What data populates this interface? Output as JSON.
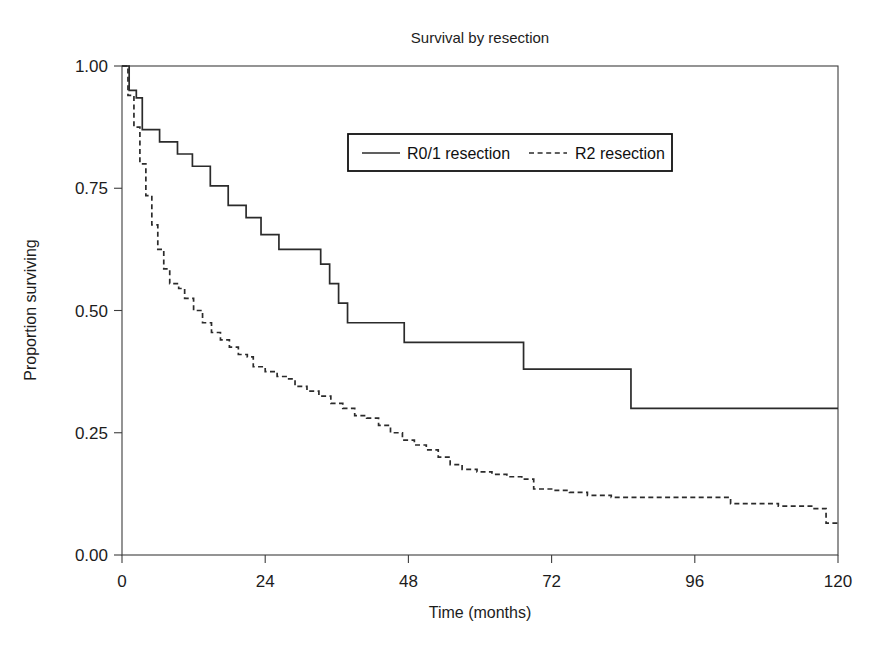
{
  "chart_data": {
    "type": "line",
    "title": "Survival by resection",
    "xlabel": "Time (months)",
    "ylabel": "Proportion surviving",
    "xlim": [
      0,
      120
    ],
    "ylim": [
      0,
      1
    ],
    "xticks": [
      0,
      24,
      48,
      72,
      96,
      120
    ],
    "xtick_labels": [
      "0",
      "24",
      "48",
      "72",
      "96",
      "120"
    ],
    "yticks": [
      0.0,
      0.25,
      0.5,
      0.75,
      1.0
    ],
    "ytick_labels": [
      "0.00",
      "0.25",
      "0.50",
      "0.75",
      "1.00"
    ],
    "grid": false,
    "legend_position": "upper center",
    "curve_style": "step-post",
    "series": [
      {
        "name": "R0/1 resection",
        "line_style": "solid",
        "color": "#2b2b2b",
        "points": [
          [
            0,
            1.0
          ],
          [
            1.2,
            0.95
          ],
          [
            2.4,
            0.935
          ],
          [
            3.4,
            0.87
          ],
          [
            6.0,
            0.87
          ],
          [
            6.3,
            0.845
          ],
          [
            9.0,
            0.845
          ],
          [
            9.3,
            0.82
          ],
          [
            11.5,
            0.82
          ],
          [
            11.8,
            0.795
          ],
          [
            14.5,
            0.795
          ],
          [
            14.8,
            0.755
          ],
          [
            17.5,
            0.755
          ],
          [
            17.8,
            0.715
          ],
          [
            20.5,
            0.715
          ],
          [
            20.8,
            0.69
          ],
          [
            23.0,
            0.69
          ],
          [
            23.3,
            0.655
          ],
          [
            26.0,
            0.655
          ],
          [
            26.3,
            0.625
          ],
          [
            33.0,
            0.625
          ],
          [
            33.3,
            0.595
          ],
          [
            34.5,
            0.595
          ],
          [
            34.8,
            0.555
          ],
          [
            36.0,
            0.555
          ],
          [
            36.3,
            0.515
          ],
          [
            37.5,
            0.515
          ],
          [
            37.8,
            0.475
          ],
          [
            47.0,
            0.475
          ],
          [
            47.3,
            0.435
          ],
          [
            67.0,
            0.435
          ],
          [
            67.3,
            0.38
          ],
          [
            85.0,
            0.38
          ],
          [
            85.3,
            0.3
          ],
          [
            120,
            0.3
          ]
        ]
      },
      {
        "name": "R2 resection",
        "line_style": "dashed",
        "color": "#2b2b2b",
        "points": [
          [
            0,
            1.0
          ],
          [
            1.0,
            0.94
          ],
          [
            2.0,
            0.875
          ],
          [
            3.0,
            0.8
          ],
          [
            4.0,
            0.735
          ],
          [
            5.0,
            0.675
          ],
          [
            6.0,
            0.625
          ],
          [
            7.0,
            0.585
          ],
          [
            8.0,
            0.555
          ],
          [
            9.5,
            0.545
          ],
          [
            10.5,
            0.525
          ],
          [
            12.0,
            0.5
          ],
          [
            13.5,
            0.475
          ],
          [
            15.0,
            0.455
          ],
          [
            16.5,
            0.44
          ],
          [
            18.0,
            0.425
          ],
          [
            19.5,
            0.41
          ],
          [
            21.0,
            0.405
          ],
          [
            22.0,
            0.385
          ],
          [
            24.0,
            0.375
          ],
          [
            26.0,
            0.365
          ],
          [
            27.5,
            0.36
          ],
          [
            29.0,
            0.345
          ],
          [
            31.0,
            0.335
          ],
          [
            33.0,
            0.325
          ],
          [
            35.0,
            0.31
          ],
          [
            37.0,
            0.3
          ],
          [
            39.0,
            0.285
          ],
          [
            41.0,
            0.28
          ],
          [
            43.0,
            0.265
          ],
          [
            45.0,
            0.25
          ],
          [
            47.0,
            0.235
          ],
          [
            49.0,
            0.225
          ],
          [
            51.0,
            0.215
          ],
          [
            53.0,
            0.2
          ],
          [
            55.0,
            0.185
          ],
          [
            57.0,
            0.175
          ],
          [
            59.5,
            0.17
          ],
          [
            62.0,
            0.165
          ],
          [
            64.5,
            0.16
          ],
          [
            67.0,
            0.155
          ],
          [
            69.0,
            0.135
          ],
          [
            72.0,
            0.132
          ],
          [
            75.0,
            0.128
          ],
          [
            78.0,
            0.122
          ],
          [
            82.0,
            0.118
          ],
          [
            86.0,
            0.118
          ],
          [
            92.0,
            0.118
          ],
          [
            98.0,
            0.118
          ],
          [
            102.0,
            0.105
          ],
          [
            110.0,
            0.1
          ],
          [
            116.0,
            0.095
          ],
          [
            118.0,
            0.065
          ],
          [
            120,
            0.065
          ]
        ]
      }
    ]
  },
  "legend": {
    "entries": [
      {
        "label": "R0/1 resection",
        "style": "solid"
      },
      {
        "label": "R2 resection",
        "style": "dashed"
      }
    ]
  }
}
